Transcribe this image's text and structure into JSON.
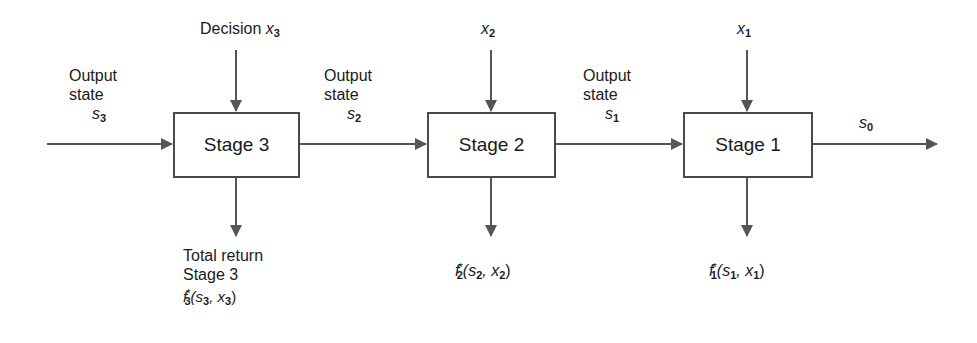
{
  "diagram": {
    "type": "serial multistage decision process (dynamic programming)",
    "colors": {
      "line": "#555555",
      "box_border": "#4a4a4a",
      "text": "#1a1a1a",
      "background": "#ffffff"
    },
    "stages": [
      {
        "label": "Stage 3",
        "decision": "Decision",
        "decision_var": "x",
        "decision_sub": "3",
        "return_label_1": "Total return",
        "return_label_2": "Stage 3",
        "return_fn": "f",
        "return_fn_sub": "3",
        "return_fn_sup": "*",
        "return_args": "(s",
        "return_arg1_sub": "3",
        "return_mid": ", x",
        "return_arg2_sub": "3",
        "return_end": ")"
      },
      {
        "label": "Stage 2",
        "decision_var": "x",
        "decision_sub": "2",
        "return_fn": "f",
        "return_fn_sub": "2",
        "return_fn_sup": "*",
        "return_args": "(s",
        "return_arg1_sub": "2",
        "return_mid": ", x",
        "return_arg2_sub": "2",
        "return_end": ")"
      },
      {
        "label": "Stage 1",
        "decision_var": "x",
        "decision_sub": "1",
        "return_fn": "f",
        "return_fn_sub": "1",
        "return_fn_sup": "*",
        "return_args": "(s",
        "return_arg1_sub": "1",
        "return_mid": ", x",
        "return_arg2_sub": "1",
        "return_end": ")"
      }
    ],
    "states": [
      {
        "line1": "Output",
        "line2": "state",
        "var": "s",
        "sub": "3"
      },
      {
        "line1": "Output",
        "line2": "state",
        "var": "s",
        "sub": "2"
      },
      {
        "line1": "Output",
        "line2": "state",
        "var": "s",
        "sub": "1"
      },
      {
        "var": "s",
        "sub": "0"
      }
    ]
  }
}
